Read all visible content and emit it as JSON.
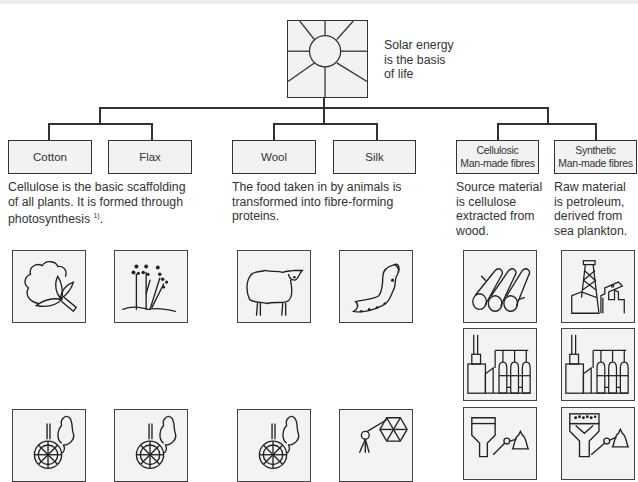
{
  "root": {
    "icon": "sun-icon",
    "caption_lines": [
      "Solar energy",
      "is the basis",
      "of life"
    ]
  },
  "groups": [
    {
      "id": "natural-plant",
      "boxes": [
        {
          "label": "Cotton"
        },
        {
          "label": "Flax"
        }
      ],
      "description_lines": [
        "Cellulose is the basic scaffolding",
        "of all plants. It is formed through",
        "photosynthesis"
      ],
      "footnote": "1)",
      "footnote_suffix": "."
    },
    {
      "id": "natural-animal",
      "boxes": [
        {
          "label": "Wool"
        },
        {
          "label": "Silk"
        }
      ],
      "description_lines": [
        "The food taken in by animals is",
        "transformed into fibre-forming",
        "proteins."
      ]
    },
    {
      "id": "man-made",
      "boxes": [
        {
          "label_line1": "Cellulosic",
          "label_line2": "Man-made fibres"
        },
        {
          "label_line1": "Synthetic",
          "label_line2": "Man-made fibres"
        }
      ],
      "descriptions": [
        [
          "Source material",
          "is cellulose",
          "extracted from",
          "wood."
        ],
        [
          "Raw material",
          "is petroleum,",
          "derived from",
          "sea plankton."
        ]
      ]
    }
  ],
  "tiles": {
    "row1": [
      "cotton-plant-icon",
      "flax-plant-icon",
      "sheep-icon",
      "silkworm-icon",
      "wood-logs-icon",
      "oil-derrick-icon"
    ],
    "row2": [
      "chemical-plant-icon",
      "chemical-plant-icon"
    ],
    "row3": [
      "spinning-wheel-icon",
      "spinning-wheel-icon",
      "spinning-wheel-icon",
      "silk-reel-icon",
      "spinneret-bath-icon",
      "melt-spinning-icon"
    ]
  },
  "colors": {
    "line": "#333333",
    "box_fill": "#f2f2f2",
    "tile_fill": "#f3f3f3",
    "background": "#ffffff"
  }
}
